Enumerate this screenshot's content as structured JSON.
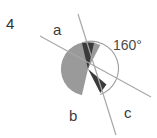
{
  "figure": {
    "problem_number": "4",
    "labels": {
      "ray_a": "a",
      "region_b": "b",
      "ray_c": "c",
      "angle_measure": "160°"
    },
    "colors": {
      "background": "#ffffff",
      "sector_fill": "#9a9a9a",
      "wedge_fill": "#3a3a3a",
      "line_stroke": "#a6a6a6",
      "arc_stroke": "#9e9e9e",
      "text": "#3b3b3b"
    },
    "geometry": {
      "vertex_x": 88,
      "vertex_y": 69,
      "circle_radius": 27,
      "line_a_x1": 40,
      "line_a_y1": 36,
      "line_a_x2": 151,
      "line_a_y2": 97,
      "line_c_x1": 78,
      "line_c_y1": 14,
      "line_c_x2": 116,
      "line_c_y2": 135,
      "arc_start_deg": 103,
      "arc_end_deg": 297,
      "arc_radius": 26,
      "sector_start_deg": 103,
      "sector_end_deg": 297,
      "wedge_start_deg": 77,
      "wedge_end_deg": 103
    }
  }
}
